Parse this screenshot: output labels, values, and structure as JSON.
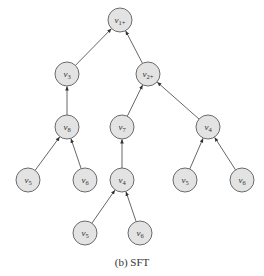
{
  "diagram": {
    "type": "tree",
    "caption": "(b) SFT",
    "node_fill": "#e3e3e3",
    "node_stroke": "#6a6a6a",
    "edge_color": "#555555",
    "nodes": [
      {
        "id": "n1",
        "label": "v",
        "sub": "1+",
        "x": 120,
        "y": 20
      },
      {
        "id": "n2",
        "label": "v",
        "sub": "3",
        "x": 67,
        "y": 74
      },
      {
        "id": "n3",
        "label": "v",
        "sub": "2+",
        "x": 148,
        "y": 74
      },
      {
        "id": "n4",
        "label": "v",
        "sub": "8",
        "x": 67,
        "y": 127
      },
      {
        "id": "n5",
        "label": "v",
        "sub": "7",
        "x": 122,
        "y": 127
      },
      {
        "id": "n6",
        "label": "v",
        "sub": "4",
        "x": 208,
        "y": 127
      },
      {
        "id": "n7",
        "label": "v",
        "sub": "5",
        "x": 28,
        "y": 180
      },
      {
        "id": "n8",
        "label": "v",
        "sub": "6",
        "x": 85,
        "y": 180
      },
      {
        "id": "n9",
        "label": "v",
        "sub": "4",
        "x": 122,
        "y": 180
      },
      {
        "id": "n10",
        "label": "v",
        "sub": "5",
        "x": 185,
        "y": 180
      },
      {
        "id": "n11",
        "label": "v",
        "sub": "6",
        "x": 242,
        "y": 180
      },
      {
        "id": "n12",
        "label": "v",
        "sub": "5",
        "x": 85,
        "y": 233
      },
      {
        "id": "n13",
        "label": "v",
        "sub": "6",
        "x": 140,
        "y": 233
      }
    ],
    "edges": [
      {
        "from": "n2",
        "to": "n1"
      },
      {
        "from": "n3",
        "to": "n1"
      },
      {
        "from": "n4",
        "to": "n2"
      },
      {
        "from": "n5",
        "to": "n3"
      },
      {
        "from": "n6",
        "to": "n3"
      },
      {
        "from": "n7",
        "to": "n4"
      },
      {
        "from": "n8",
        "to": "n4"
      },
      {
        "from": "n9",
        "to": "n5"
      },
      {
        "from": "n10",
        "to": "n6"
      },
      {
        "from": "n11",
        "to": "n6"
      },
      {
        "from": "n12",
        "to": "n9"
      },
      {
        "from": "n13",
        "to": "n9"
      }
    ]
  }
}
